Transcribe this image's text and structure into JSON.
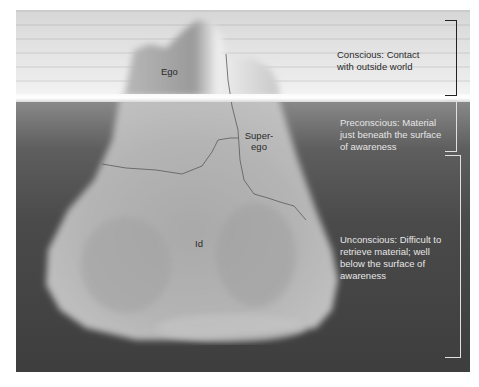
{
  "diagram": {
    "type": "iceberg model of the mind",
    "structures": [
      {
        "id": "ego",
        "label": "Ego"
      },
      {
        "id": "superego",
        "label_line1": "Super-",
        "label_line2": "ego"
      },
      {
        "id": "id",
        "label": "Id"
      }
    ],
    "levels": [
      {
        "id": "conscious",
        "line1": "Conscious: Contact",
        "line2": "with outside world"
      },
      {
        "id": "preconscious",
        "line1": "Preconscious: Material",
        "line2": "just beneath the surface",
        "line3": "of awareness"
      },
      {
        "id": "unconscious",
        "line1": "Unconscious: Difficult to",
        "line2": "retrieve material; well",
        "line3": "below the surface of",
        "line4": "awareness"
      }
    ],
    "colors": {
      "sky": "#e2e2e2",
      "water": "#4a4a4a",
      "ice": "#b5b5b5",
      "bracket_top": "#222222",
      "bracket_bottom": "#e0e0e0"
    }
  }
}
